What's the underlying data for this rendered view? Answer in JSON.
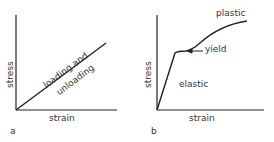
{
  "panels": [
    {
      "id": "a",
      "panel_label": "a",
      "xlabel": "strain",
      "ylabel": "stress",
      "line_label_1": "loading and",
      "line_label_2": "unloading"
    },
    {
      "id": "b",
      "panel_label": "b",
      "xlabel": "strain",
      "ylabel": "stress",
      "region_elastic": "elastic",
      "region_plastic": "plastic",
      "annotation_yield": "yield"
    }
  ],
  "colors": {
    "ink": "#222222",
    "background": "#ffffff"
  }
}
